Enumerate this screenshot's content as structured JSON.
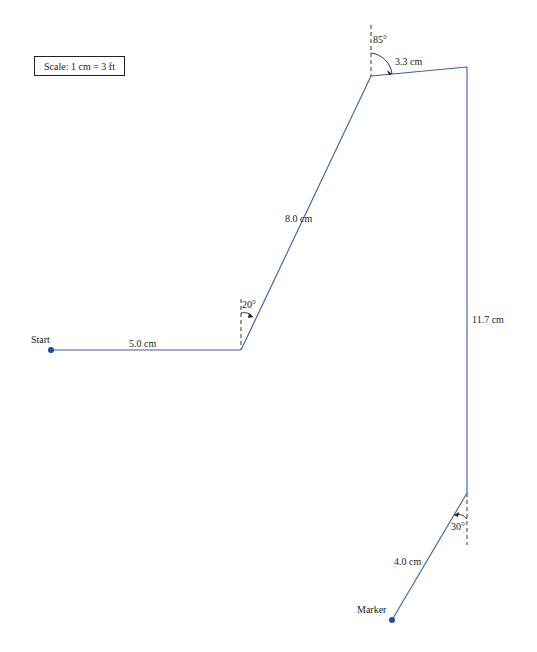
{
  "diagram": {
    "type": "displacement-path",
    "scale_label": "Scale: 1 cm = 3 ft",
    "start_label": "Start",
    "end_label": "Marker",
    "colors": {
      "path": "#3b5fa6",
      "point": "#1f4f99",
      "text": "#222222",
      "reference": "#333333"
    },
    "segments": [
      {
        "label": "5.0 cm",
        "direction": "east"
      },
      {
        "label": "8.0 cm",
        "angle_label": "20°",
        "angle_reference": "vertical"
      },
      {
        "label": "3.3 cm",
        "angle_label": "85°",
        "angle_reference": "vertical"
      },
      {
        "label": "11.7 cm",
        "direction": "south"
      },
      {
        "label": "4.0 cm",
        "angle_label": "30°",
        "angle_reference": "vertical"
      }
    ]
  }
}
